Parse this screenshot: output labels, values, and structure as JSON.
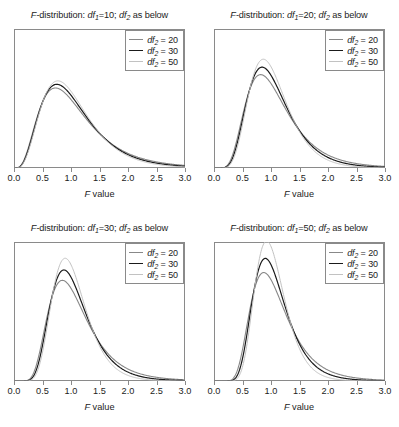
{
  "figure": {
    "background": "#ffffff",
    "axis_title": "F value",
    "axis_title_italic_part": "F",
    "axis_title_rest": " value",
    "xticks": [
      "0.0",
      "0.5",
      "1.0",
      "1.5",
      "2.0",
      "2.5",
      "3.0"
    ],
    "xtick_values": [
      0.0,
      0.5,
      1.0,
      1.5,
      2.0,
      2.5,
      3.0
    ],
    "title_prefix": "F",
    "title_mid": "-distribution: ",
    "title_df1_label": "df",
    "title_df1_sub": "1",
    "title_sep": "; ",
    "title_df2_label": "df",
    "title_df2_sub": "2",
    "title_suffix": " as below",
    "legend_label": "df",
    "legend_sub": "2",
    "legend_eq": " = "
  },
  "chart_data": {
    "type": "line",
    "xlabel": "F value",
    "ylabel": "",
    "xlim": [
      0,
      3
    ],
    "ylim": [
      0,
      1.45
    ],
    "grid": false,
    "legend_position": "top-right",
    "panels": [
      {
        "id": "panel-df1-10",
        "position": "top-left",
        "title": "F-distribution: df1=10; df2 as below",
        "df1": 10,
        "series": [
          {
            "name": "df2 = 20",
            "df2": 20,
            "color": "#888888",
            "width": 1.1,
            "peak_x": 0.79,
            "peak_y": 0.83
          },
          {
            "name": "df2 = 30",
            "df2": 30,
            "color": "#1a1a1a",
            "width": 1.2,
            "peak_x": 0.78,
            "peak_y": 0.8
          },
          {
            "name": "df2 = 50",
            "df2": 50,
            "color": "#c2c2c2",
            "width": 1.0,
            "peak_x": 0.8,
            "peak_y": 0.86
          }
        ]
      },
      {
        "id": "panel-df1-20",
        "position": "top-right",
        "title": "F-distribution: df1=20; df2 as below",
        "df1": 20,
        "series": [
          {
            "name": "df2 = 20",
            "df2": 20,
            "color": "#888888",
            "width": 1.1,
            "peak_x": 0.88,
            "peak_y": 1.02
          },
          {
            "name": "df2 = 30",
            "df2": 30,
            "color": "#1a1a1a",
            "width": 1.2,
            "peak_x": 0.89,
            "peak_y": 1.08
          },
          {
            "name": "df2 = 50",
            "df2": 50,
            "color": "#c2c2c2",
            "width": 1.0,
            "peak_x": 0.9,
            "peak_y": 1.14
          }
        ]
      },
      {
        "id": "panel-df1-30",
        "position": "bottom-left",
        "title": "F-distribution: df1=30; df2 as below",
        "df1": 30,
        "series": [
          {
            "name": "df2 = 20",
            "df2": 20,
            "color": "#888888",
            "width": 1.1,
            "peak_x": 0.9,
            "peak_y": 1.1
          },
          {
            "name": "df2 = 30",
            "df2": 30,
            "color": "#1a1a1a",
            "width": 1.2,
            "peak_x": 0.92,
            "peak_y": 1.19
          },
          {
            "name": "df2 = 50",
            "df2": 50,
            "color": "#c2c2c2",
            "width": 1.0,
            "peak_x": 0.93,
            "peak_y": 1.29
          }
        ]
      },
      {
        "id": "panel-df1-50",
        "position": "bottom-right",
        "title": "F-distribution: df1=50; df2 as below",
        "df1": 50,
        "series": [
          {
            "name": "df2 = 20",
            "df2": 20,
            "color": "#888888",
            "width": 1.1,
            "peak_x": 0.92,
            "peak_y": 1.16
          },
          {
            "name": "df2 = 30",
            "df2": 30,
            "color": "#1a1a1a",
            "width": 1.2,
            "peak_x": 0.94,
            "peak_y": 1.28
          },
          {
            "name": "df2 = 50",
            "df2": 50,
            "color": "#c2c2c2",
            "width": 1.0,
            "peak_x": 0.95,
            "peak_y": 1.42
          }
        ]
      }
    ]
  }
}
